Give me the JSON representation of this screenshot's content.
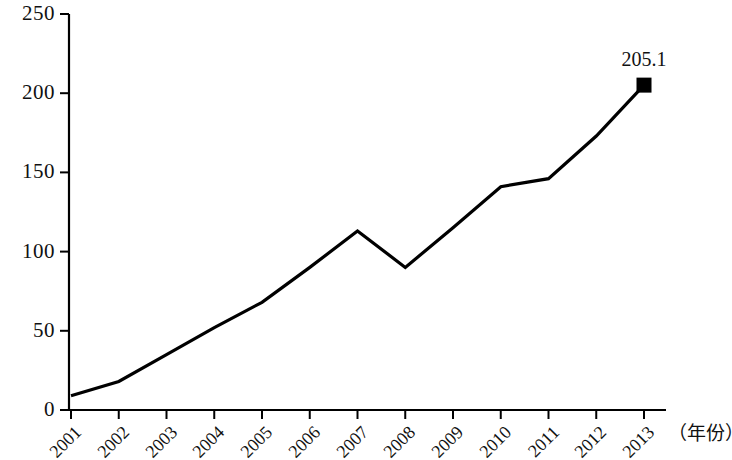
{
  "chart_data": {
    "type": "line",
    "title": "",
    "subtitle": "",
    "xlabel": "（年份）",
    "ylabel": "",
    "grid": false,
    "legend": false,
    "categories": [
      "2001",
      "2002",
      "2003",
      "2004",
      "2005",
      "2006",
      "2007",
      "2008",
      "2009",
      "2010",
      "2011",
      "2012",
      "2013"
    ],
    "values": [
      9,
      18,
      35,
      52,
      68,
      90,
      113,
      90,
      115,
      141,
      146,
      173,
      205.1
    ],
    "series": [
      {
        "name": "",
        "values": [
          9,
          18,
          35,
          52,
          68,
          90,
          113,
          90,
          115,
          141,
          146,
          173,
          205.1
        ]
      }
    ],
    "ylim": [
      0,
      250
    ],
    "yticks": [
      0,
      50,
      100,
      150,
      200,
      250
    ],
    "ytick_labels": [
      "0",
      "50",
      "100",
      "150",
      "200",
      "250"
    ],
    "xtick_labels": [
      "2001",
      "2002",
      "2003",
      "2004",
      "2005",
      "2006",
      "2007",
      "2008",
      "2009",
      "2010",
      "2011",
      "2012",
      "2013"
    ],
    "annotations": [
      {
        "text": "205.1",
        "x": "2013",
        "y": 205.1
      }
    ],
    "markers": [
      {
        "x": "2013",
        "y": 205.1,
        "shape": "square",
        "color": "#000000"
      }
    ],
    "line_color": "#000000",
    "line_width": 3,
    "axis_color": "#000000"
  },
  "axis": {
    "x_label": "（年份）"
  }
}
